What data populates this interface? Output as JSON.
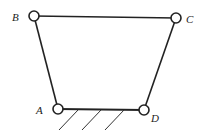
{
  "diagram": {
    "title": "",
    "type": "four-bar linkage",
    "joints": [
      {
        "id": "A",
        "label": "A",
        "x": 58,
        "y": 109,
        "label_x": 36,
        "label_y": 114
      },
      {
        "id": "B",
        "label": "B",
        "x": 34,
        "y": 16,
        "label_x": 12,
        "label_y": 21
      },
      {
        "id": "C",
        "label": "C",
        "x": 176,
        "y": 18,
        "label_x": 186,
        "label_y": 23
      },
      {
        "id": "D",
        "label": "D",
        "x": 144,
        "y": 110,
        "label_x": 151,
        "label_y": 122
      }
    ],
    "links": [
      {
        "from": "A",
        "to": "B"
      },
      {
        "from": "B",
        "to": "C"
      },
      {
        "from": "C",
        "to": "D"
      },
      {
        "from": "A",
        "to": "D",
        "ground": true
      }
    ],
    "ground_hatch_count": 3,
    "colors": {
      "line": "#222222",
      "joint_fill": "#ffffff"
    }
  }
}
